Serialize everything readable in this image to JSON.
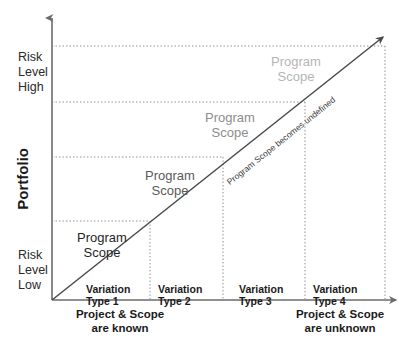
{
  "figure": {
    "type": "diagram",
    "background_color": "#ffffff"
  },
  "axes": {
    "y": {
      "label": "Portfolio",
      "top_marker": {
        "label_lines": [
          "Risk",
          "Level",
          "High"
        ]
      },
      "bottom_marker": {
        "label_lines": [
          "Risk",
          "Level",
          "Low"
        ]
      },
      "color": "#6b6b6b"
    },
    "x": {
      "left_caption_lines": [
        "Project & Scope",
        "are known"
      ],
      "right_caption_lines": [
        "Project & Scope",
        "are unknown"
      ],
      "color": "#6b6b6b"
    }
  },
  "diagonal": {
    "label": "Program Scope becomes undefined",
    "color": "#4a4a4a",
    "has_arrowhead": true
  },
  "segments": [
    {
      "variation_lines": [
        "Variation",
        "Type 1"
      ],
      "scope_lines": [
        "Program",
        "Scope"
      ],
      "scope_color": "#1f1f1f"
    },
    {
      "variation_lines": [
        "Variation",
        "Type 2"
      ],
      "scope_lines": [
        "Program",
        "Scope"
      ],
      "scope_color": "#5a5a5a"
    },
    {
      "variation_lines": [
        "Variation",
        "Type 3"
      ],
      "scope_lines": [
        "Program",
        "Scope"
      ],
      "scope_color": "#8d8d8d"
    },
    {
      "variation_lines": [
        "Variation",
        "Type 4"
      ],
      "scope_lines": [
        "Program",
        "Scope"
      ],
      "scope_color": "#b5b5b5"
    }
  ],
  "grid": {
    "dotted_color": "#8c8c8c",
    "horizontal_levels": 4,
    "vertical_dividers": 4
  }
}
